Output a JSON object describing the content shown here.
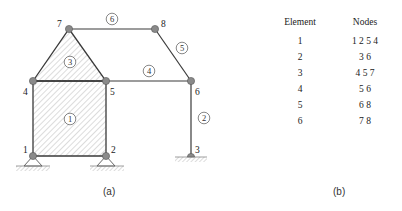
{
  "figure_a": {
    "caption": "(a)",
    "nodes": [
      {
        "id": "1",
        "x": 33,
        "y": 156
      },
      {
        "id": "2",
        "x": 106,
        "y": 156
      },
      {
        "id": "3",
        "x": 191,
        "y": 156
      },
      {
        "id": "4",
        "x": 33,
        "y": 81
      },
      {
        "id": "5",
        "x": 106,
        "y": 81
      },
      {
        "id": "6",
        "x": 191,
        "y": 81
      },
      {
        "id": "7",
        "x": 69,
        "y": 29
      },
      {
        "id": "8",
        "x": 155,
        "y": 29
      }
    ],
    "element_labels": [
      "1",
      "2",
      "3",
      "4",
      "5",
      "6"
    ],
    "node_labels": [
      "1",
      "2",
      "3",
      "4",
      "5",
      "6",
      "7",
      "8"
    ]
  },
  "figure_b": {
    "caption": "(b)",
    "headers": {
      "element": "Element",
      "nodes": "Nodes"
    },
    "rows": [
      {
        "element": "1",
        "nodes": "1 2 5 4"
      },
      {
        "element": "2",
        "nodes": "3 6"
      },
      {
        "element": "3",
        "nodes": "4 5 7"
      },
      {
        "element": "4",
        "nodes": "5 6"
      },
      {
        "element": "5",
        "nodes": "6 8"
      },
      {
        "element": "6",
        "nodes": "7 8"
      }
    ]
  },
  "colors": {
    "line": "#3a3a3a",
    "node": "#8a8a8a",
    "hatch": "#9a9a9a"
  }
}
